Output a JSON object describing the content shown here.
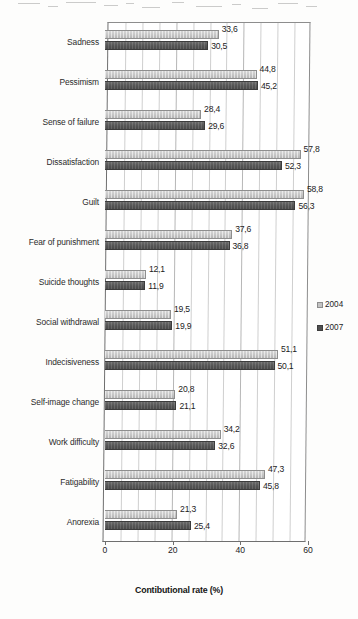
{
  "chart_data": {
    "type": "bar",
    "orientation": "horizontal",
    "title": "",
    "xlabel": "Contibutional rate (%)",
    "ylabel": "",
    "xlim": [
      0,
      60
    ],
    "xticks": [
      0,
      20,
      40,
      60
    ],
    "xtick_labels": [
      "0",
      "20",
      "40",
      "60"
    ],
    "grid": true,
    "grid_axis": "x",
    "legend_position": "right",
    "categories": [
      "Sadness",
      "Pessimism",
      "Sense of failure",
      "Dissatisfaction",
      "Guilt",
      "Fear of punishment",
      "Suicide thoughts",
      "Social withdrawal",
      "Indecisiveness",
      "Self-image change",
      "Work difficulty",
      "Fatigability",
      "Anorexia"
    ],
    "series": [
      {
        "name": "2004",
        "color": "#c3c3c3",
        "values": [
          33.6,
          44.8,
          28.4,
          57.8,
          58.8,
          37.6,
          12.1,
          19.5,
          51.1,
          20.8,
          34.2,
          47.3,
          21.3
        ],
        "value_labels": [
          "33,6",
          "44,8",
          "28,4",
          "57,8",
          "58,8",
          "37,6",
          "12,1",
          "19,5",
          "51,1",
          "20,8",
          "34,2",
          "47,3",
          "21,3"
        ]
      },
      {
        "name": "2007",
        "color": "#4f4f4f",
        "values": [
          30.5,
          45.2,
          29.6,
          52.3,
          56.3,
          36.8,
          11.9,
          19.9,
          50.1,
          21.1,
          32.6,
          45.8,
          25.4
        ],
        "value_labels": [
          "30,5",
          "45,2",
          "29,6",
          "52,3",
          "56,3",
          "36,8",
          "11,9",
          "19,9",
          "50,1",
          "21,1",
          "32,6",
          "45,8",
          "25,4"
        ]
      }
    ]
  },
  "legend": {
    "items": [
      {
        "label": "2004",
        "marker": "square-marker-light"
      },
      {
        "label": "2007",
        "marker": "square-marker-dark"
      }
    ]
  }
}
